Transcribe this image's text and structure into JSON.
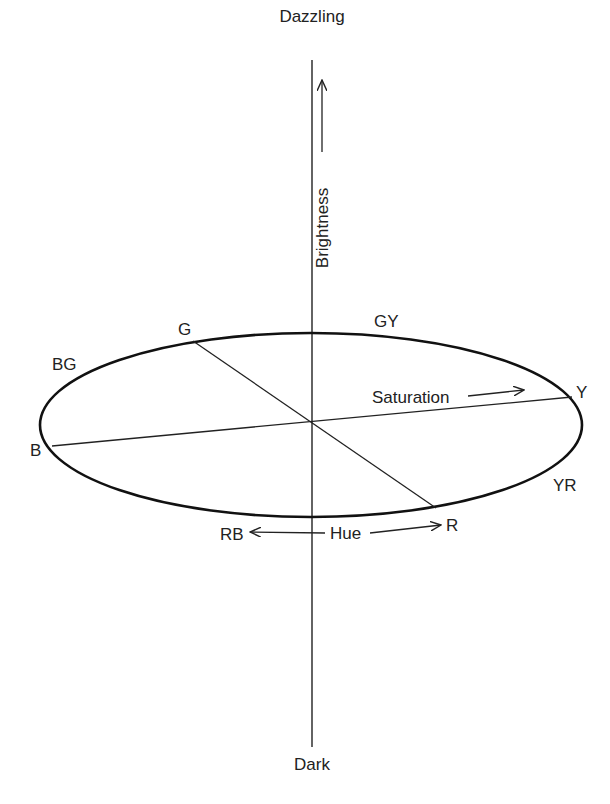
{
  "diagram": {
    "type": "color-solid",
    "axis": {
      "top_label": "Dazzling",
      "bottom_label": "Dark",
      "quantity_label": "Brightness"
    },
    "saturation_label": "Saturation",
    "hue_label": "Hue",
    "hue_points": [
      {
        "id": "G",
        "label": "G"
      },
      {
        "id": "GY",
        "label": "GY"
      },
      {
        "id": "Y",
        "label": "Y"
      },
      {
        "id": "YR",
        "label": "YR"
      },
      {
        "id": "R",
        "label": "R"
      },
      {
        "id": "RB",
        "label": "RB"
      },
      {
        "id": "B",
        "label": "B"
      },
      {
        "id": "BG",
        "label": "BG"
      }
    ],
    "colors": {
      "line": "#222222",
      "background": "#ffffff"
    }
  }
}
